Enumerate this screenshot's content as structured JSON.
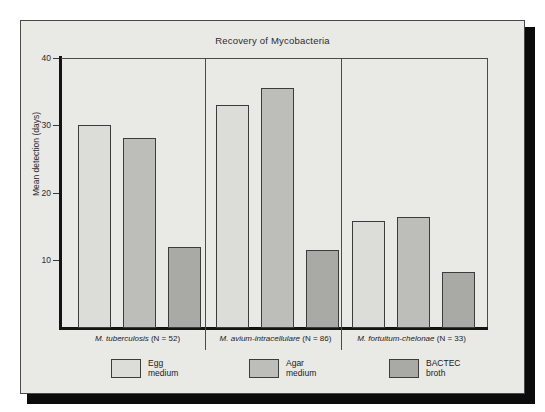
{
  "figure": {
    "background_color": "#e9e9e6",
    "frame_color": "#4a4a48",
    "axis_color": "#141414"
  },
  "chart_data": {
    "type": "bar",
    "title": "Recovery of Mycobacteria",
    "xlabel": "",
    "ylabel": "Mean detection (days)",
    "ylim": [
      0,
      40
    ],
    "yticks": [
      10,
      20,
      30,
      40
    ],
    "ytick_labels": [
      "10",
      "20",
      "30",
      "40"
    ],
    "grid": false,
    "legend_position": "bottom",
    "categories": [
      "M. tuberculosis (N = 52)",
      "M. avium-intracellulare (N = 86)",
      "M. fortuitum-chelonae (N = 33)"
    ],
    "category_species": [
      "M. tuberculosis",
      "M. avium-intracellulare",
      "M. fortuitum-chelonae"
    ],
    "category_counts": [
      "(N = 52)",
      "(N = 86)",
      "(N = 33)"
    ],
    "series": [
      {
        "name": "Egg medium",
        "name_line1": "Egg",
        "name_line2": "medium",
        "color": "#dcdcd8",
        "values": [
          30.2,
          33.2,
          15.9
        ]
      },
      {
        "name": "Agar medium",
        "name_line1": "Agar",
        "name_line2": "medium",
        "color": "#bdbdb9",
        "values": [
          28.3,
          35.7,
          16.5
        ]
      },
      {
        "name": "BACTEC broth",
        "name_line1": "BACTEC",
        "name_line2": "broth",
        "color": "#a9a9a5",
        "values": [
          12.1,
          11.6,
          8.3
        ]
      }
    ]
  }
}
